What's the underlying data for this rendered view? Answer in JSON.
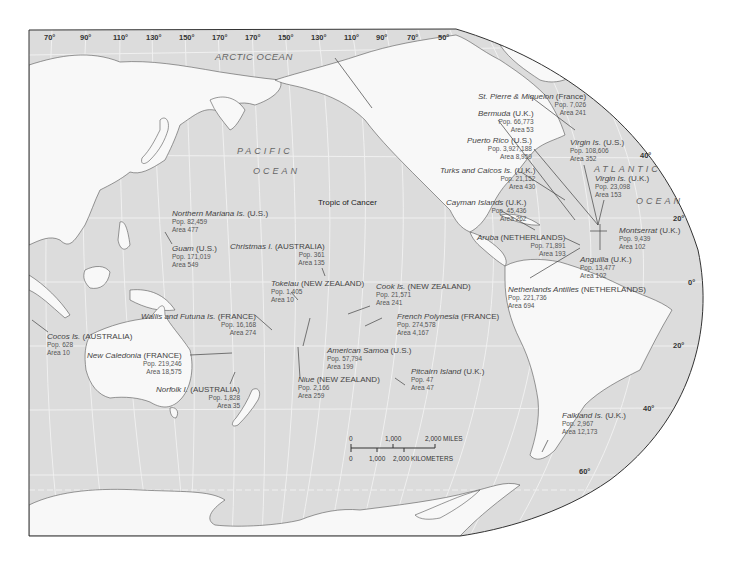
{
  "map": {
    "title": "Pacific Ocean dependencies map",
    "colors": {
      "ocean": "#dcdcdc",
      "land": "#f8f8f8",
      "coast": "#555555",
      "graticule": "#f2f2f2",
      "border": "#333333"
    },
    "oceans": {
      "arctic": "ARCTIC OCEAN",
      "pacific_1": "PACIFIC",
      "pacific_2": "OCEAN",
      "atlantic_1": "ATLANTIC",
      "atlantic_2": "OCEAN"
    },
    "top_ticks": [
      "70°",
      "90°",
      "110°",
      "130°",
      "150°",
      "170°",
      "170°",
      "150°",
      "130°",
      "110°",
      "90°",
      "70°",
      "50°"
    ],
    "lat_ticks": [
      "40°",
      "20°",
      "0°",
      "20°",
      "40°",
      "60°"
    ],
    "tropic": "Tropic of Cancer",
    "territories": [
      {
        "name": "St. Pierre & Miquelon",
        "owner": "(France)",
        "pop": "Pop. 7,026",
        "area": "Area 241"
      },
      {
        "name": "Bermuda",
        "owner": "(U.K.)",
        "pop": "Pop. 66,773",
        "area": "Area 53"
      },
      {
        "name": "Puerto Rico",
        "owner": "(U.S.)",
        "pop": "Pop. 3,927,188",
        "area": "Area 8,959"
      },
      {
        "name": "Virgin Is.",
        "owner": "(U.S.)",
        "pop": "Pop. 108,606",
        "area": "Area 352"
      },
      {
        "name": "Turks and Caicos Is.",
        "owner": "(U.K.)",
        "pop": "Pop. 21,152",
        "area": "Area 430"
      },
      {
        "name": "Virgin Is.",
        "owner": "(U.K.)",
        "pop": "Pop. 23,098",
        "area": "Area 153"
      },
      {
        "name": "Cayman Islands",
        "owner": "(U.K.)",
        "pop": "Pop. 45,436",
        "area": "Area 262"
      },
      {
        "name": "Montserrat",
        "owner": "(U.K.)",
        "pop": "Pop. 9,439",
        "area": "Area 102"
      },
      {
        "name": "Aruba",
        "owner": "(NETHERLANDS)",
        "pop": "Pop. 71,891",
        "area": "Area 193"
      },
      {
        "name": "Anguilla",
        "owner": "(U.K.)",
        "pop": "Pop. 13,477",
        "area": "Area 102"
      },
      {
        "name": "Netherlands Antilles",
        "owner": "(NETHERLANDS)",
        "pop": "Pop. 221,736",
        "area": "Area 694"
      },
      {
        "name": "Northern Mariana Is.",
        "owner": "(U.S.)",
        "pop": "Pop. 82,459",
        "area": "Area 477"
      },
      {
        "name": "Guam",
        "owner": "(U.S.)",
        "pop": "Pop. 171,019",
        "area": "Area 549"
      },
      {
        "name": "Christmas I.",
        "owner": "(AUSTRALIA)",
        "pop": "Pop. 361",
        "area": "Area 135"
      },
      {
        "name": "Tokelau",
        "owner": "(NEW ZEALAND)",
        "pop": "Pop. 1,405",
        "area": "Area 10"
      },
      {
        "name": "Cook Is.",
        "owner": "(NEW ZEALAND)",
        "pop": "Pop. 21,571",
        "area": "Area 241"
      },
      {
        "name": "Wallis and Futuna Is.",
        "owner": "(FRANCE)",
        "pop": "Pop. 16,168",
        "area": "Area 274"
      },
      {
        "name": "French Polynesia",
        "owner": "(FRANCE)",
        "pop": "Pop. 274,578",
        "area": "Area 4,167"
      },
      {
        "name": "Cocos Is.",
        "owner": "(AUSTRALIA)",
        "pop": "Pop. 628",
        "area": "Area 10"
      },
      {
        "name": "New Caledonia",
        "owner": "(FRANCE)",
        "pop": "Pop. 219,246",
        "area": "Area 18,575"
      },
      {
        "name": "American Samoa",
        "owner": "(U.S.)",
        "pop": "Pop. 57,794",
        "area": "Area 199"
      },
      {
        "name": "Norfolk I.",
        "owner": "(AUSTRALIA)",
        "pop": "Pop. 1,828",
        "area": "Area 35"
      },
      {
        "name": "Niue",
        "owner": "(NEW ZEALAND)",
        "pop": "Pop. 2,166",
        "area": "Area 259"
      },
      {
        "name": "Pitcairn Island",
        "owner": "(U.K.)",
        "pop": "Pop. 47",
        "area": "Area 47"
      },
      {
        "name": "Falkland Is.",
        "owner": "(U.K.)",
        "pop": "Pop. 2,967",
        "area": "Area 12,173"
      }
    ],
    "scale_bar": {
      "miles": [
        "0",
        "1,000",
        "2,000 MILES"
      ],
      "km": [
        "0",
        "1,000",
        "2,000 KILOMETERS"
      ]
    }
  }
}
